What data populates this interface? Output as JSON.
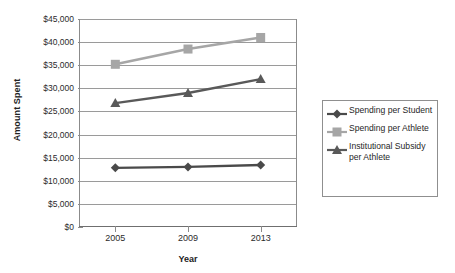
{
  "chart_data": {
    "type": "line",
    "title": "",
    "xlabel": "Year",
    "ylabel": "Amount Spent",
    "categories": [
      "2005",
      "2009",
      "2013"
    ],
    "x": [
      2005,
      2009,
      2013
    ],
    "ylim": [
      0,
      45000
    ],
    "ytick_step": 5000,
    "ytick_labels": [
      "$0",
      "$5,000",
      "$10,000",
      "$15,000",
      "$20,000",
      "$25,000",
      "$30,000",
      "$35,000",
      "$40,000",
      "$45,000"
    ],
    "ytick_values": [
      0,
      5000,
      10000,
      15000,
      20000,
      25000,
      30000,
      35000,
      40000,
      45000
    ],
    "grid": true,
    "legend_position": "right",
    "series": [
      {
        "name": "Spending per Student",
        "values": [
          12800,
          13000,
          13400
        ],
        "color": "#4a4a4a",
        "marker": "diamond"
      },
      {
        "name": "Spending per Athlete",
        "values": [
          35200,
          38500,
          41000
        ],
        "color": "#a6a6a6",
        "marker": "square"
      },
      {
        "name": "Institutional Subsidy per Athlete",
        "values": [
          26800,
          29000,
          32000
        ],
        "color": "#595959",
        "marker": "triangle"
      }
    ]
  },
  "legend": {
    "items": [
      {
        "label": "Spending per Student",
        "color": "#4a4a4a",
        "marker": "diamond"
      },
      {
        "label": "Spending per Athlete",
        "color": "#a6a6a6",
        "marker": "square"
      },
      {
        "label": "Institutional Subsidy per Athlete",
        "color": "#595959",
        "marker": "triangle"
      }
    ]
  },
  "axes": {
    "y_title": "Amount Spent",
    "x_title": "Year"
  },
  "colors": {
    "grid": "#9a9a9a",
    "axis": "#8b8b8b",
    "text": "#2b2b2b",
    "background": "#ffffff"
  }
}
